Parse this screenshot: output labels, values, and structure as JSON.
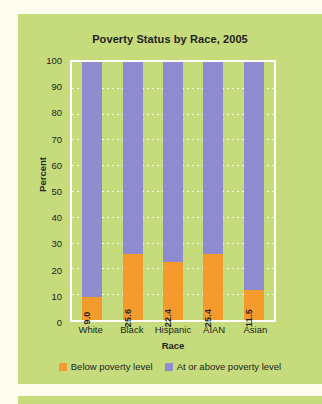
{
  "chart_data": {
    "type": "bar",
    "subtype": "stacked-100",
    "title": "Poverty Status by Race, 2005",
    "xlabel": "Race",
    "ylabel": "Percent",
    "categories": [
      "White",
      "Black",
      "Hispanic",
      "AIAN",
      "Asian"
    ],
    "ylim": [
      0,
      100
    ],
    "yticks": [
      100,
      90,
      80,
      70,
      60,
      50,
      40,
      30,
      20,
      10,
      0
    ],
    "grid": true,
    "legend_position": "bottom",
    "series": [
      {
        "name": "Below poverty level",
        "color": "#f59b2e",
        "values": [
          9.0,
          25.6,
          22.4,
          25.4,
          11.5
        ],
        "labels": [
          "9.0",
          "25.6",
          "22.4",
          "25.4",
          "11.5"
        ]
      },
      {
        "name": "At or above poverty level",
        "color": "#8f8bd0",
        "values": [
          91.0,
          74.4,
          77.6,
          74.6,
          88.5
        ],
        "labels": [
          "",
          "",
          "",
          "",
          ""
        ]
      }
    ]
  },
  "colors": {
    "panel_background": "#c5db7c",
    "page_background": "#fdfcef",
    "below_poverty": "#f59b2e",
    "at_or_above_poverty": "#8f8bd0",
    "plot_border": "#ffffff",
    "text": "#231f20"
  }
}
